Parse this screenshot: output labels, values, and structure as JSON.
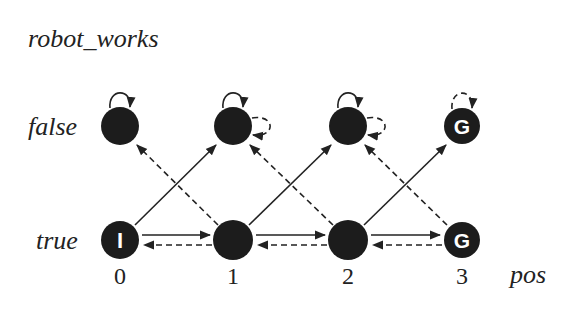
{
  "diagram": {
    "title": "robot_works",
    "row_labels": {
      "false": "false",
      "true": "true"
    },
    "x_axis_label": "pos",
    "columns": [
      "0",
      "1",
      "2",
      "3"
    ],
    "nodes": {
      "f0": {
        "col": 0,
        "row": "false",
        "label": ""
      },
      "f1": {
        "col": 1,
        "row": "false",
        "label": ""
      },
      "f2": {
        "col": 2,
        "row": "false",
        "label": ""
      },
      "f3": {
        "col": 3,
        "row": "false",
        "label": "G"
      },
      "t0": {
        "col": 0,
        "row": "true",
        "label": "I"
      },
      "t1": {
        "col": 1,
        "row": "true",
        "label": ""
      },
      "t2": {
        "col": 2,
        "row": "true",
        "label": ""
      },
      "t3": {
        "col": 3,
        "row": "true",
        "label": "G"
      }
    },
    "legend_note": "solid arrows and dashed arrows denote two action types",
    "colors": {
      "node": "#1c1c1c",
      "edge": "#222222",
      "background": "#ffffff"
    }
  }
}
